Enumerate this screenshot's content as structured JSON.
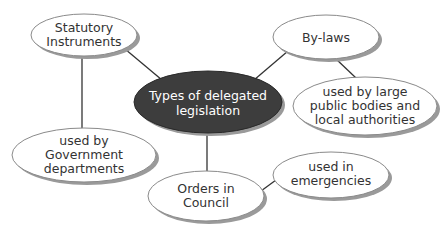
{
  "diagram": {
    "type": "mind-map",
    "colors": {
      "background": "#ffffff",
      "center_fill": "#3d3d3d",
      "node_fill": "#ffffff",
      "node_stroke": "#8a8a8a",
      "shadow": "#9a9a9a",
      "connector": "#333333",
      "text_dark": "#333333",
      "text_light": "#ffffff"
    },
    "central": {
      "lines": [
        "Types of delegated",
        "legislation"
      ]
    },
    "nodes": {
      "statutory": {
        "lines": [
          "Statutory",
          "Instruments"
        ]
      },
      "bylaws": {
        "lines": [
          "By-laws"
        ]
      },
      "public_bodies": {
        "lines": [
          "used by large",
          "public bodies and",
          "local authorities"
        ]
      },
      "government": {
        "lines": [
          "used by",
          "Government",
          "departments"
        ]
      },
      "orders": {
        "lines": [
          "Orders in",
          "Council"
        ]
      },
      "emergencies": {
        "lines": [
          "used in",
          "emergencies"
        ]
      }
    },
    "edges": [
      {
        "from": "central",
        "to": "statutory"
      },
      {
        "from": "central",
        "to": "bylaws"
      },
      {
        "from": "central",
        "to": "orders"
      },
      {
        "from": "statutory",
        "to": "government"
      },
      {
        "from": "bylaws",
        "to": "public_bodies"
      },
      {
        "from": "orders",
        "to": "emergencies"
      }
    ]
  }
}
